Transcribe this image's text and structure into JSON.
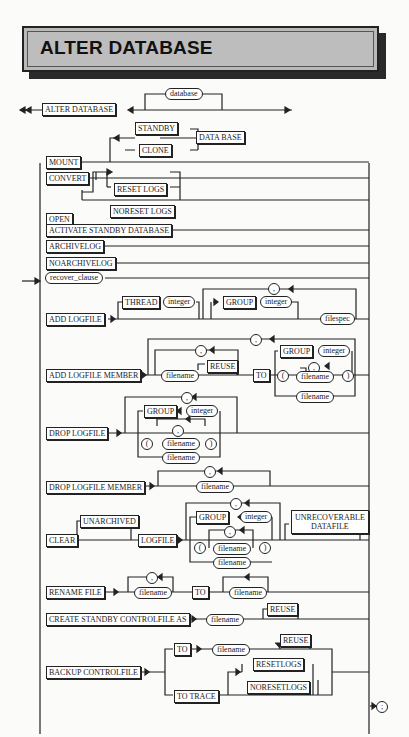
{
  "title": "ALTER DATABASE",
  "diagram": {
    "start": {
      "keyword": "ALTER DATABASE",
      "optional": "database"
    },
    "mount": {
      "keyword": "MOUNT",
      "options": [
        "STANDBY",
        "CLONE"
      ],
      "suffix": "DATA BASE"
    },
    "convert": "CONVERT",
    "open": {
      "keyword": "OPEN",
      "options": [
        "RESET LOGS",
        "NORESET LOGS"
      ]
    },
    "activate": "ACTIVATE STANDBY DATABASE",
    "archivelog": "ARCHIVELOG",
    "noarchivelog": "NOARCHIVELOG",
    "recover": "recover_clause",
    "add_logfile": {
      "keyword": "ADD LOGFILE",
      "thread": "THREAD",
      "integer": "integer",
      "group": "GROUP",
      "comma": ",",
      "filespec": "filespec"
    },
    "add_member": {
      "keyword": "ADD LOGFILE MEMBER",
      "filename": "filename",
      "reuse": "REUSE",
      "to": "TO",
      "group": "GROUP",
      "integer": "integer",
      "lparen": "(",
      "rparen": ")",
      "comma": ","
    },
    "drop_logfile": {
      "keyword": "DROP LOGFILE",
      "group": "GROUP",
      "integer": "integer",
      "filename": "filename",
      "lparen": "(",
      "rparen": ")",
      "comma": ","
    },
    "drop_member": {
      "keyword": "DROP LOGFILE MEMBER",
      "filename": "filename",
      "comma": ","
    },
    "clear": {
      "keyword": "CLEAR",
      "unarchived": "UNARCHIVED",
      "logfile": "LOGFILE",
      "group": "GROUP",
      "integer": "integer",
      "filename": "filename",
      "lparen": "(",
      "rparen": ")",
      "comma": ",",
      "unrecoverable": "UNRECOVERABLE",
      "datafile": "DATAFILE"
    },
    "rename": {
      "keyword": "RENAME FILE",
      "filename": "filename",
      "to": "TO",
      "comma": ","
    },
    "create_standby": {
      "keyword": "CREATE STANDBY CONTROLFILE AS",
      "filename": "filename",
      "reuse": "REUSE"
    },
    "backup": {
      "keyword": "BACKUP CONTROLFILE",
      "to": "TO",
      "filename": "filename",
      "reuse": "REUSE",
      "to_trace": "TO TRACE",
      "resetlogs": "RESETLOGS",
      "noresetlogs": "NORESETLOGS"
    },
    "end_symbol": ";"
  }
}
